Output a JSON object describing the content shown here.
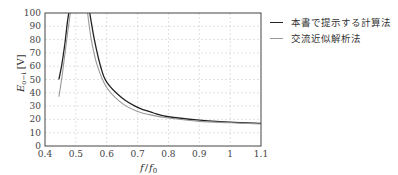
{
  "chart_data": {
    "type": "line",
    "title": "",
    "xlabel": "f / f0",
    "ylabel": "E_{o-i} [V]",
    "xlim": [
      0.4,
      1.1
    ],
    "ylim": [
      0,
      100
    ],
    "xticks": [
      "0.4",
      "0.5",
      "0.6",
      "0.7",
      "0.8",
      "0.9",
      "1",
      "1.1"
    ],
    "yticks": [
      "0",
      "10",
      "20",
      "30",
      "40",
      "50",
      "60",
      "70",
      "80",
      "90",
      "100"
    ],
    "grid": true,
    "legend_position": "right-outside",
    "series": [
      {
        "name": "本書で提示する計算法",
        "color": "#222222",
        "branches": [
          {
            "x": [
              0.445,
              0.455,
              0.465,
              0.472,
              0.477
            ],
            "y": [
              50,
              62,
              78,
              92,
              100
            ]
          },
          {
            "x": [
              0.545,
              0.56,
              0.58,
              0.6,
              0.65,
              0.7,
              0.75,
              0.8,
              0.9,
              1.0,
              1.1
            ],
            "y": [
              100,
              80,
              60,
              48,
              36,
              29,
              25,
              22,
              19.5,
              18,
              17
            ]
          }
        ]
      },
      {
        "name": "交流近似解析法",
        "color": "#999999",
        "branches": [
          {
            "x": [
              0.445,
              0.455,
              0.465,
              0.475,
              0.482
            ],
            "y": [
              37,
              52,
              70,
              88,
              100
            ]
          },
          {
            "x": [
              0.538,
              0.55,
              0.57,
              0.6,
              0.65,
              0.7,
              0.75,
              0.8,
              0.9,
              1.0,
              1.1
            ],
            "y": [
              100,
              80,
              60,
              44,
              32,
              26,
              23,
              21,
              18.5,
              17.5,
              16.5
            ]
          }
        ]
      }
    ]
  },
  "legend": {
    "items": [
      {
        "label": "本書で提示する計算法",
        "color": "#222222"
      },
      {
        "label": "交流近似解析法",
        "color": "#999999"
      }
    ]
  },
  "axes": {
    "ylabel_main": "E",
    "ylabel_sub": "o−i",
    "ylabel_unit": "[V]",
    "xlabel_f": "f",
    "xlabel_slash": "/",
    "xlabel_f0": "f",
    "xlabel_f0_sub": "0"
  }
}
